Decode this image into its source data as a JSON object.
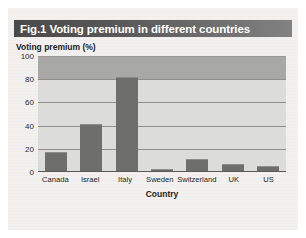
{
  "figure": {
    "label": "Fig.1",
    "title": "Voting premium in different countries",
    "full_title": "Fig.1 Voting premium in different countries"
  },
  "chart_data": {
    "type": "bar",
    "title": "Fig.1 Voting premium in different countries",
    "subtitle": "",
    "categories": [
      "Canada",
      "Israel",
      "Italy",
      "Sweden",
      "Switzerland",
      "UK",
      "US"
    ],
    "values": [
      17,
      41,
      82,
      3,
      11,
      7,
      5
    ],
    "xlabel": "Country",
    "ylabel": "Voting premium (%)",
    "ylim": [
      0,
      100
    ],
    "yticks": [
      0,
      20,
      40,
      60,
      80,
      100
    ],
    "ytick_labels": [
      "0",
      "20",
      "40",
      "60",
      "80",
      "100"
    ],
    "grid": true,
    "legend": "none",
    "series_color": "#6e6e6c",
    "plot_bg_color": "#dcdcda",
    "upper_band_color": "#a8a8a6",
    "title_bar_color": "#575757"
  }
}
